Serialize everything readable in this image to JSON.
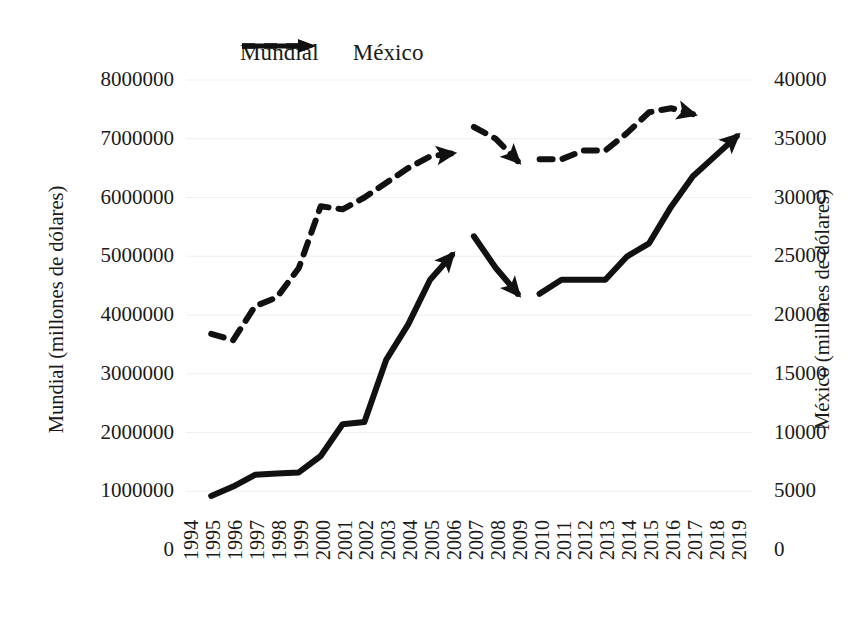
{
  "legend": {
    "items": [
      {
        "label": "Mundial",
        "style": "dashed-arrow",
        "color": "#111111"
      },
      {
        "label": "México",
        "style": "solid-arrow",
        "color": "#111111"
      }
    ]
  },
  "axes": {
    "y_left_title": "Mundial (millones de dólares)",
    "y_right_title": "México (millones de dólares)",
    "y_left_ticks": [
      "8000000",
      "7000000",
      "6000000",
      "5000000",
      "4000000",
      "3000000",
      "2000000",
      "1000000",
      "0"
    ],
    "y_right_ticks": [
      "40000",
      "35000",
      "30000",
      "25000",
      "20000",
      "15000",
      "10000",
      "5000",
      "0"
    ],
    "x_ticks": [
      "1994",
      "1995",
      "1996",
      "1997",
      "1998",
      "1999",
      "2000",
      "2001",
      "2002",
      "2003",
      "2004",
      "2005",
      "2006",
      "2007",
      "2008",
      "2009",
      "2010",
      "2011",
      "2012",
      "2013",
      "2014",
      "2015",
      "2016",
      "2017",
      "2018",
      "2019"
    ]
  },
  "chart_data": {
    "type": "line",
    "title": "",
    "xlabel": "",
    "ylabel": "Mundial (millones de dólares)",
    "y2label": "México (millones de dólares)",
    "ylim": [
      0,
      8000000
    ],
    "y2lim": [
      0,
      40000
    ],
    "grid": true,
    "legend_position": "top",
    "x": [
      "1994",
      "1995",
      "1996",
      "1997",
      "1998",
      "1999",
      "2000",
      "2001",
      "2002",
      "2003",
      "2004",
      "2005",
      "2006",
      "2007",
      "2008",
      "2009",
      "2010",
      "2011",
      "2012",
      "2013",
      "2014",
      "2015",
      "2016",
      "2017",
      "2018",
      "2019"
    ],
    "series": [
      {
        "name": "Mundial",
        "axis": "left",
        "style": "dashed",
        "arrow_end": true,
        "segments": [
          {
            "x": [
              "1995",
              "1996",
              "1997",
              "1998",
              "1999",
              "2000",
              "2001",
              "2002",
              "2003",
              "2004",
              "2005",
              "2006"
            ],
            "values": [
              3680000,
              3570000,
              4150000,
              4300000,
              4800000,
              5850000,
              5800000,
              6000000,
              6250000,
              6500000,
              6700000,
              6750000
            ]
          },
          {
            "x": [
              "2007",
              "2008",
              "2009"
            ],
            "values": [
              7200000,
              7000000,
              6620000
            ]
          },
          {
            "x": [
              "2010",
              "2011",
              "2012",
              "2013",
              "2014",
              "2015",
              "2016",
              "2017"
            ],
            "values": [
              6650000,
              6650000,
              6800000,
              6800000,
              7100000,
              7450000,
              7520000,
              7420000
            ]
          }
        ]
      },
      {
        "name": "México",
        "axis": "right",
        "style": "solid",
        "arrow_end": true,
        "segments": [
          {
            "x": [
              "1995",
              "1996",
              "1997",
              "1998",
              "1999",
              "2000",
              "2001",
              "2002",
              "2003",
              "2004",
              "2005",
              "2006"
            ],
            "values": [
              4600,
              5400,
              6400,
              6500,
              6600,
              8000,
              10700,
              10900,
              16200,
              19200,
              23000,
              25100
            ]
          },
          {
            "x": [
              "2007",
              "2008",
              "2009"
            ],
            "values": [
              26700,
              24000,
              21800
            ]
          },
          {
            "x": [
              "2010",
              "2011",
              "2012",
              "2013",
              "2014",
              "2015",
              "2016",
              "2017",
              "2018",
              "2019"
            ],
            "values": [
              21800,
              23000,
              23000,
              23000,
              25000,
              26100,
              29200,
              31800,
              33500,
              35200
            ]
          }
        ]
      }
    ]
  },
  "colors": {
    "line": "#111111",
    "grid": "#efefef",
    "text": "#1a1a1a",
    "background": "#ffffff"
  }
}
